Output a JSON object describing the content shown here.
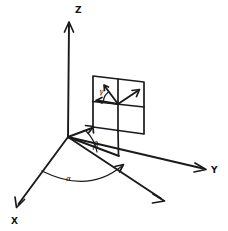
{
  "figure": {
    "background_color": "#ffffff",
    "ink_color": "#1a1a1a",
    "width": 228,
    "height": 231
  },
  "axes": [
    {
      "id": "z",
      "label": "Z",
      "label_x": 75,
      "label_y": 13,
      "from": [
        68,
        137
      ],
      "to": [
        69,
        22
      ],
      "arrow": "up"
    },
    {
      "id": "y",
      "label": "Y",
      "label_x": 211,
      "label_y": 173,
      "from": [
        68,
        137
      ],
      "to": [
        205,
        169
      ],
      "arrow": "right-down"
    },
    {
      "id": "x",
      "label": "X",
      "label_x": 12,
      "label_y": 224,
      "from": [
        68,
        137
      ],
      "to": [
        17,
        206
      ],
      "arrow": "left-down"
    }
  ],
  "rays": [
    {
      "id": "projection-ray",
      "description": "in-plane projection ray toward lower right",
      "from": [
        68,
        137
      ],
      "to": [
        163,
        200
      ],
      "arrow": true
    },
    {
      "id": "beta-helper-ray",
      "description": "helper line from origin to plane base",
      "from": [
        68,
        137
      ],
      "to": [
        117,
        155
      ],
      "arrow": false
    },
    {
      "id": "panel-connector",
      "description": "line from origin to panel bottom-left corner",
      "from": [
        68,
        137
      ],
      "to": [
        93,
        127
      ],
      "arrow": true
    }
  ],
  "panel": {
    "id": "detector-plane",
    "description": "tilted square detector plane divided into four quadrants",
    "corners": {
      "top_left": [
        93,
        76
      ],
      "top_right": [
        144,
        82
      ],
      "bottom_right": [
        144,
        134
      ],
      "bottom_left": [
        93,
        127
      ]
    },
    "grid": {
      "vertical_from": [
        118,
        79
      ],
      "vertical_to": [
        118,
        131
      ],
      "horizontal_from": [
        93,
        102
      ],
      "horizontal_to": [
        144,
        106
      ]
    },
    "vectors": [
      {
        "id": "gamma-reference-vector",
        "description": "short vector pointing up-left from panel center",
        "from": [
          118,
          104
        ],
        "to": [
          104,
          85
        ],
        "arrow": true
      },
      {
        "id": "scattering-vector",
        "description": "vector pointing up-right from panel center",
        "from": [
          118,
          104
        ],
        "to": [
          139,
          90
        ],
        "arrow": true
      },
      {
        "id": "gamma-left-vector",
        "description": "short vector pointing left from panel center toward left edge",
        "from": [
          118,
          104
        ],
        "to": [
          96,
          100
        ],
        "arrow": true
      }
    ]
  },
  "angles": [
    {
      "id": "alpha",
      "label": "α",
      "label_x": 69,
      "label_y": 180,
      "description": "azimuthal angle between X axis and projection ray, measured in the horizontal plane",
      "arc_from": [
        44,
        172
      ],
      "arc_to": [
        133,
        169
      ],
      "arc_radius": 72
    },
    {
      "id": "beta",
      "label": "β",
      "label_x": 95,
      "label_y": 147,
      "description": "elevation angle between projection ray and plane connector",
      "arc_from": [
        88,
        132
      ],
      "arc_to": [
        99,
        150
      ],
      "arc_radius": 25
    },
    {
      "id": "gamma",
      "label": "γ",
      "label_x": 100,
      "label_y": 94,
      "description": "in-plane angle at panel center between left vector and up-left vector",
      "arc_from": [
        107,
        90
      ],
      "arc_to": [
        101,
        100
      ],
      "arc_radius": 13
    }
  ]
}
